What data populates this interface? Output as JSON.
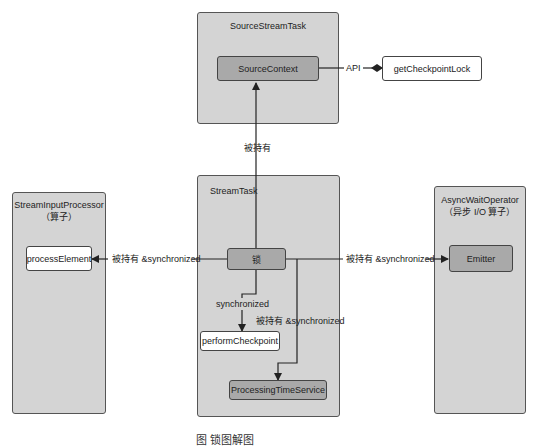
{
  "diagram": {
    "containers": {
      "source_stream_task": {
        "title": "SourceStreamTask"
      },
      "stream_input_processor": {
        "title": "StreamInputProcessor",
        "subtitle": "（算子）"
      },
      "stream_task": {
        "title": "StreamTask"
      },
      "async_wait_operator": {
        "title": "AsyncWaitOperator",
        "subtitle": "（异步 I/O 算子）"
      }
    },
    "nodes": {
      "source_context": "SourceContext",
      "get_checkpoint_lock": "getCheckpointLock",
      "process_element": "processElement",
      "lock": "锁",
      "emitter": "Emitter",
      "perform_checkpoint": "performCheckpoint",
      "processing_time_service": "ProcessingTimeService"
    },
    "edges": {
      "api": "API",
      "held_by": "被持有",
      "held_sync_left": "被持有 &synchronized",
      "held_sync_right": "被持有 &synchronized",
      "synchronized": "synchronized",
      "held_sync_down": "被持有 &synchronized"
    },
    "colors": {
      "container_fill": "#d4d4d4",
      "dark_node_fill": "#a9a9a9",
      "white_node_fill": "#ffffff",
      "line": "#222222"
    },
    "caption": "图          锁图解图"
  }
}
